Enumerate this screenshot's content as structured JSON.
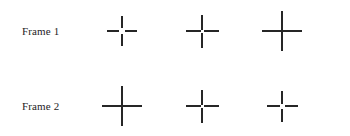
{
  "figure": {
    "background_color": "#ffffff",
    "stroke_color": "#262626",
    "width": 350,
    "height": 136
  },
  "rows": [
    {
      "label": "Frame 1",
      "stimuli": [
        {
          "name": "cross-large-gap",
          "gap_px": 6,
          "arm_length_px": 12,
          "stroke_px": 2,
          "description": "plus sign with large central gap"
        },
        {
          "name": "cross-small-gap",
          "gap_px": 3,
          "arm_length_px": 15,
          "stroke_px": 2,
          "description": "plus sign with small central gap"
        },
        {
          "name": "cross-solid",
          "gap_px": 0,
          "arm_length_px": 20,
          "stroke_px": 2,
          "description": "continuous solid plus sign"
        }
      ]
    },
    {
      "label": "Frame 2",
      "stimuli": [
        {
          "name": "cross-solid",
          "gap_px": 0,
          "arm_length_px": 20,
          "stroke_px": 2,
          "description": "continuous solid plus sign"
        },
        {
          "name": "cross-small-gap",
          "gap_px": 3,
          "arm_length_px": 15,
          "stroke_px": 2,
          "description": "plus sign with small central gap"
        },
        {
          "name": "cross-large-gap",
          "gap_px": 5,
          "arm_length_px": 13,
          "stroke_px": 2,
          "description": "plus sign with large central gap"
        }
      ]
    }
  ]
}
